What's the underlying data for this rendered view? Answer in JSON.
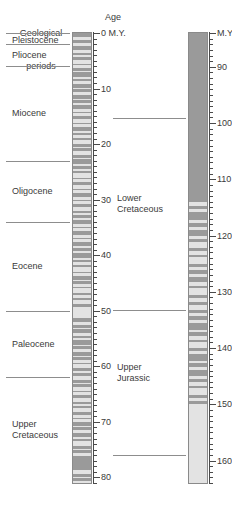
{
  "figure": {
    "type": "geologic-time-scale",
    "headers": {
      "periods_line1": "Geological",
      "periods_line2": "periods",
      "age": "Age"
    }
  },
  "cenozoic_column": {
    "axis_unit": "0 M.Y.",
    "range_my": [
      0,
      81
    ],
    "tick_interval_minor": 1,
    "tick_interval_major": 10,
    "tick_labels": [
      "0 M.Y.",
      "10",
      "20",
      "30",
      "40",
      "50",
      "60",
      "70",
      "80"
    ],
    "tick_values": [
      0,
      10,
      20,
      30,
      40,
      50,
      60,
      70,
      80
    ],
    "periods": [
      {
        "name": "Pleistocene",
        "lines": [
          "Pleistocene"
        ],
        "start_my": 0,
        "end_my": 2
      },
      {
        "name": "Pliocene",
        "lines": [
          "Pliocene"
        ],
        "start_my": 2,
        "end_my": 6
      },
      {
        "name": "Miocene",
        "lines": [
          "Miocene"
        ],
        "start_my": 6,
        "end_my": 23
      },
      {
        "name": "Oligocene",
        "lines": [
          "Oligocene"
        ],
        "start_my": 23,
        "end_my": 34
      },
      {
        "name": "Eocene",
        "lines": [
          "Eocene"
        ],
        "start_my": 34,
        "end_my": 50
      },
      {
        "name": "Paleocene",
        "lines": [
          "Paleocene"
        ],
        "start_my": 50,
        "end_my": 62
      },
      {
        "name": "Upper Cretaceous",
        "lines": [
          "Upper",
          "Cretaceous"
        ],
        "start_my": 62,
        "end_my": 81
      }
    ]
  },
  "mesozoic_column": {
    "axis_unit": "M.Y.",
    "range_my": [
      84,
      164
    ],
    "tick_interval_minor": 1,
    "tick_interval_major": 10,
    "tick_labels": [
      "M.Y.",
      "90",
      "100",
      "110",
      "120",
      "130",
      "140",
      "150",
      "160"
    ],
    "tick_values": [
      84,
      90,
      100,
      110,
      120,
      130,
      140,
      150,
      160
    ],
    "periods": [
      {
        "name": "Lower Cretaceous",
        "lines": [
          "Lower",
          "Cretaceous"
        ]
      },
      {
        "name": "Upper Jurassic",
        "lines": [
          "Upper",
          "Jurassic"
        ]
      }
    ]
  },
  "colors": {
    "stripe_dark": "#9a9a9a",
    "stripe_light": "#e3e3e3",
    "rule": "#8d8d8d",
    "text": "#3a3a3a",
    "background": "#ffffff"
  }
}
